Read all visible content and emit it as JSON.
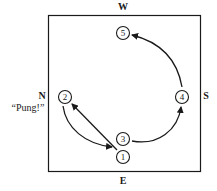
{
  "diagram": {
    "directions": {
      "top": "W",
      "bottom": "E",
      "left": "N",
      "right": "S"
    },
    "call_label": "“Pung!”",
    "seats": [
      {
        "id": "1",
        "label": "1",
        "x": 123,
        "y": 157
      },
      {
        "id": "2",
        "label": "2",
        "x": 65,
        "y": 97
      },
      {
        "id": "3",
        "label": "3",
        "x": 123,
        "y": 139
      },
      {
        "id": "4",
        "label": "4",
        "x": 182,
        "y": 97
      },
      {
        "id": "5",
        "label": "5",
        "x": 123,
        "y": 33
      }
    ],
    "arrows": [
      {
        "from": "1",
        "to": "2",
        "shape": "straight"
      },
      {
        "from": "2",
        "to": "1",
        "shape": "curved"
      },
      {
        "from": "3",
        "to": "4",
        "shape": "curved"
      },
      {
        "from": "4",
        "to": "5",
        "shape": "curved"
      }
    ],
    "colors": {
      "ink": "#1a1a1a",
      "background": "#ffffff"
    }
  }
}
